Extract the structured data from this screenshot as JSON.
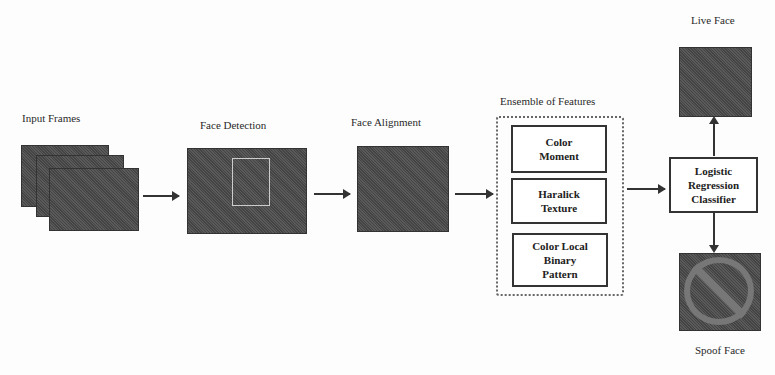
{
  "diagram": {
    "stages": [
      {
        "id": "input",
        "label": "Input Frames"
      },
      {
        "id": "detection",
        "label": "Face Detection"
      },
      {
        "id": "alignment",
        "label": "Face Alignment"
      },
      {
        "id": "features",
        "label": "Ensemble of Features"
      }
    ],
    "features": [
      {
        "line1": "Color",
        "line2": "Moment",
        "line3": ""
      },
      {
        "line1": "Haralick",
        "line2": "Texture",
        "line3": ""
      },
      {
        "line1": "Color Local",
        "line2": "Binary",
        "line3": "Pattern"
      }
    ],
    "classifier": {
      "line1": "Logistic",
      "line2": "Regression",
      "line3": "Classifier"
    },
    "outputs": {
      "live": "Live Face",
      "spoof": "Spoof Face"
    }
  }
}
